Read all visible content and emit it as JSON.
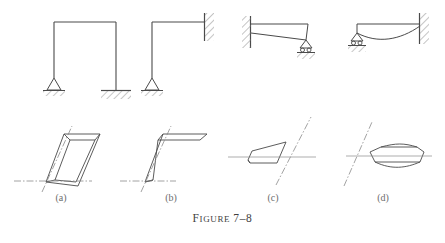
{
  "figure": {
    "caption_prefix_big": "F",
    "caption_prefix_rest": "IGURE",
    "caption_number": "7–8",
    "caption_full": "FIGURE 7–8",
    "line_color": "#4a4a4a",
    "hatch_color": "#7d7d7d",
    "axis_color": "#8a8a8a",
    "label_color": "#6d6d6d",
    "background": "#ffffff"
  },
  "panels": [
    {
      "id": "a",
      "label": "(a)",
      "top_view": "portal-frame-pinned-and-fixed-base",
      "bottom_view": "three-dimensional-buckled-portal-frame",
      "supports": [
        "pin-support",
        "fixed-base-support"
      ],
      "members": [
        "left-column",
        "top-beam",
        "right-column"
      ]
    },
    {
      "id": "b",
      "label": "(b)",
      "top_view": "L-frame-pinned-base-fixed-wall",
      "bottom_view": "three-dimensional-buckled-L-frame",
      "supports": [
        "pin-support",
        "fixed-wall-support"
      ],
      "members": [
        "column",
        "beam"
      ]
    },
    {
      "id": "c",
      "label": "(c)",
      "top_view": "cantilever-beam-fixed-left-roller-right",
      "bottom_view": "tapered-wedge-deflection-shape",
      "supports": [
        "fixed-wall-support",
        "roller-support"
      ],
      "members": [
        "beam",
        "deflected-beam"
      ]
    },
    {
      "id": "d",
      "label": "(d)",
      "top_view": "beam-roller-left-fixed-wall-right",
      "bottom_view": "symmetric-lens-deflection-shape",
      "supports": [
        "roller-support",
        "fixed-wall-support"
      ],
      "members": [
        "beam",
        "deflected-beam"
      ]
    }
  ]
}
